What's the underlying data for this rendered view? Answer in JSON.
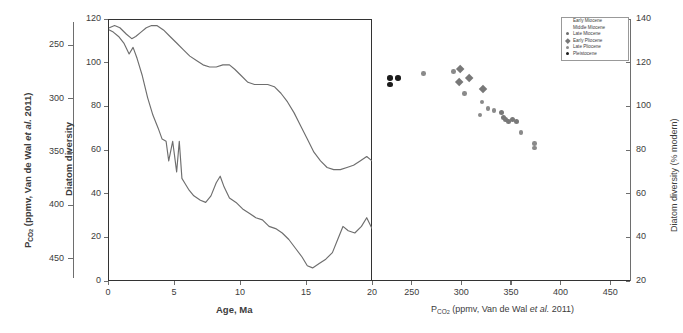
{
  "figure": {
    "left_outer_axis": {
      "title_parts": {
        "p": "P",
        "sub": "CO",
        "sub2": "2",
        "rest": " (ppmv, Van de Wal ",
        "ital": "et al.",
        "tail": " 2011)"
      },
      "title_plain": "PCO2 (ppmv, Van de Wal et al. 2011)",
      "ticks": [
        250,
        300,
        350,
        400,
        450
      ]
    },
    "left_panel": {
      "y_axis_title": "Diatom diversity",
      "y_ticks": [
        0,
        20,
        40,
        60,
        80,
        100,
        120
      ],
      "y_range": [
        0,
        120
      ],
      "x_axis_title": "Age, Ma",
      "x_ticks": [
        0,
        5,
        10,
        15,
        20
      ],
      "x_range": [
        0,
        20
      ]
    },
    "right_panel": {
      "x_axis_title_plain": "PCO2 (ppmv, Van de Wal et al. 2011)",
      "x_ticks": [
        250,
        300,
        350,
        400,
        450
      ],
      "x_range": [
        210,
        470
      ],
      "y_axis_title": "Diatom diversity (% modern)",
      "y_ticks": [
        20,
        40,
        60,
        80,
        100,
        120,
        140
      ],
      "y_range": [
        20,
        140
      ]
    },
    "legend": {
      "items": [
        {
          "label": "Early Miocene",
          "marker": "circle-open",
          "color": "#8c8c8c"
        },
        {
          "label": "Middle Miocene",
          "marker": "circle-open",
          "color": "#8c8c8c"
        },
        {
          "label": "Late Miocene",
          "marker": "circle-filled",
          "color": "#6e6e6e"
        },
        {
          "label": "Early Pliocene",
          "marker": "diamond",
          "color": "#787878"
        },
        {
          "label": "Late Pliocene",
          "marker": "circle-filled",
          "color": "#8a8a8a"
        },
        {
          "label": "Pleistocene",
          "marker": "circle-filled",
          "color": "#1c1c1c"
        }
      ]
    }
  },
  "chart_data": [
    {
      "type": "line",
      "title": "Diatom diversity and PCO2 through time",
      "xlabel": "Age, Ma",
      "ylabel": "Diatom diversity",
      "xlim": [
        0,
        20
      ],
      "ylim": [
        0,
        120
      ],
      "grid": false,
      "legend_position": "none",
      "series": [
        {
          "name": "Diatom diversity (upper curve)",
          "color": "#6e6e6e",
          "x": [
            0.1,
            0.5,
            0.9,
            1.4,
            1.8,
            2.1,
            2.5,
            2.9,
            3.3,
            3.7,
            4.2,
            4.7,
            5.2,
            5.7,
            6.2,
            6.7,
            7.2,
            7.7,
            8.2,
            8.7,
            9.2,
            9.6,
            10.1,
            10.6,
            11.1,
            11.6,
            12.1,
            12.6,
            13.1,
            13.6,
            14.1,
            14.6,
            15.1,
            15.6,
            16.1,
            16.6,
            17.1,
            17.6,
            18.1,
            18.6,
            19.1,
            19.6,
            20.0
          ],
          "y": [
            116,
            117,
            116,
            113,
            111,
            112,
            114,
            116,
            117,
            117,
            115,
            112,
            109,
            106,
            103,
            101,
            99,
            98,
            98,
            99,
            99,
            97,
            94,
            91,
            90,
            90,
            90,
            89,
            86,
            82,
            77,
            71,
            65,
            59,
            55,
            52,
            51,
            51,
            52,
            53,
            55,
            57,
            55
          ]
        },
        {
          "name": "PCO2 (lower curve, on left outer axis)",
          "color": "#6e6e6e",
          "x": [
            0.1,
            0.4,
            0.8,
            1.2,
            1.6,
            1.9,
            2.2,
            2.6,
            3.0,
            3.4,
            3.8,
            4.1,
            4.4,
            4.6,
            4.9,
            5.2,
            5.4,
            5.6,
            5.8,
            6.1,
            6.5,
            7.0,
            7.4,
            7.8,
            8.2,
            8.5,
            8.8,
            9.2,
            9.7,
            10.2,
            10.7,
            11.2,
            11.7,
            12.2,
            12.7,
            13.2,
            13.7,
            14.2,
            14.7,
            15.1,
            15.5,
            16.0,
            16.5,
            17.0,
            17.4,
            17.8,
            18.2,
            18.7,
            19.2,
            19.6,
            20.0
          ],
          "y": [
            115,
            114,
            112,
            109,
            104,
            107,
            102,
            94,
            84,
            76,
            70,
            65,
            64,
            55,
            64,
            50,
            64,
            47,
            45,
            42,
            39,
            37,
            36,
            39,
            45,
            48,
            43,
            38,
            36,
            33,
            31,
            29,
            28,
            25,
            24,
            22,
            19,
            15,
            11,
            7,
            6,
            8,
            10,
            13,
            19,
            25,
            23,
            22,
            25,
            29,
            24
          ]
        }
      ]
    },
    {
      "type": "scatter",
      "title": "Diatom diversity vs PCO2",
      "xlabel": "PCO2 (ppmv, Van de Wal et al. 2011)",
      "ylabel": "Diatom diversity (% modern)",
      "xlim": [
        210,
        470
      ],
      "ylim": [
        20,
        140
      ],
      "grid": false,
      "legend_position": "top-right",
      "points": [
        {
          "x": 228,
          "y": 113,
          "group": "Pleistocene",
          "marker": "circle-filled",
          "color": "#1c1c1c",
          "size": 5.6
        },
        {
          "x": 228,
          "y": 110,
          "group": "Pleistocene",
          "marker": "circle-filled",
          "color": "#1c1c1c",
          "size": 5.6
        },
        {
          "x": 236,
          "y": 113,
          "group": "Pleistocene",
          "marker": "circle-filled",
          "color": "#1c1c1c",
          "size": 5.6
        },
        {
          "x": 262,
          "y": 115,
          "group": "Late Pliocene",
          "marker": "circle-filled",
          "color": "#8a8a8a",
          "size": 4.6
        },
        {
          "x": 292,
          "y": 116,
          "group": "Late Pliocene",
          "marker": "circle-filled",
          "color": "#8a8a8a",
          "size": 4.6
        },
        {
          "x": 299,
          "y": 117,
          "group": "Early Pliocene",
          "marker": "diamond",
          "color": "#787878",
          "size": 6.4
        },
        {
          "x": 298,
          "y": 111,
          "group": "Early Pliocene",
          "marker": "diamond",
          "color": "#787878",
          "size": 6.4
        },
        {
          "x": 308,
          "y": 113,
          "group": "Early Pliocene",
          "marker": "diamond",
          "color": "#787878",
          "size": 6.4
        },
        {
          "x": 303,
          "y": 106,
          "group": "Late Miocene",
          "marker": "circle-filled",
          "color": "#8a8a8a",
          "size": 4.6
        },
        {
          "x": 322,
          "y": 108,
          "group": "Early Pliocene",
          "marker": "diamond",
          "color": "#787878",
          "size": 6.0
        },
        {
          "x": 321,
          "y": 102,
          "group": "Late Miocene",
          "marker": "circle-filled",
          "color": "#8a8a8a",
          "size": 4.6
        },
        {
          "x": 327,
          "y": 99,
          "group": "Late Miocene",
          "marker": "circle-filled",
          "color": "#8a8a8a",
          "size": 4.6
        },
        {
          "x": 319,
          "y": 96,
          "group": "Late Miocene",
          "marker": "circle-filled",
          "color": "#8a8a8a",
          "size": 4.6
        },
        {
          "x": 333,
          "y": 98,
          "group": "Late Miocene",
          "marker": "circle-filled",
          "color": "#8a8a8a",
          "size": 4.6
        },
        {
          "x": 340,
          "y": 97,
          "group": "Middle Miocene",
          "marker": "circle-filled",
          "color": "#787878",
          "size": 5.0
        },
        {
          "x": 343,
          "y": 95,
          "group": "Middle Miocene",
          "marker": "circle-filled",
          "color": "#787878",
          "size": 5.0
        },
        {
          "x": 345,
          "y": 94,
          "group": "Middle Miocene",
          "marker": "circle-filled",
          "color": "#787878",
          "size": 5.0
        },
        {
          "x": 348,
          "y": 93,
          "group": "Middle Miocene",
          "marker": "circle-filled",
          "color": "#787878",
          "size": 5.0
        },
        {
          "x": 352,
          "y": 94,
          "group": "Middle Miocene",
          "marker": "circle-filled",
          "color": "#787878",
          "size": 5.0
        },
        {
          "x": 356,
          "y": 93,
          "group": "Middle Miocene",
          "marker": "circle-filled",
          "color": "#787878",
          "size": 5.0
        },
        {
          "x": 360,
          "y": 88,
          "group": "Early Miocene",
          "marker": "circle-filled",
          "color": "#8a8a8a",
          "size": 4.6
        },
        {
          "x": 374,
          "y": 83,
          "group": "Early Miocene",
          "marker": "circle-filled",
          "color": "#8a8a8a",
          "size": 4.6
        },
        {
          "x": 374,
          "y": 81,
          "group": "Early Miocene",
          "marker": "circle-filled",
          "color": "#8a8a8a",
          "size": 4.6
        }
      ]
    }
  ]
}
